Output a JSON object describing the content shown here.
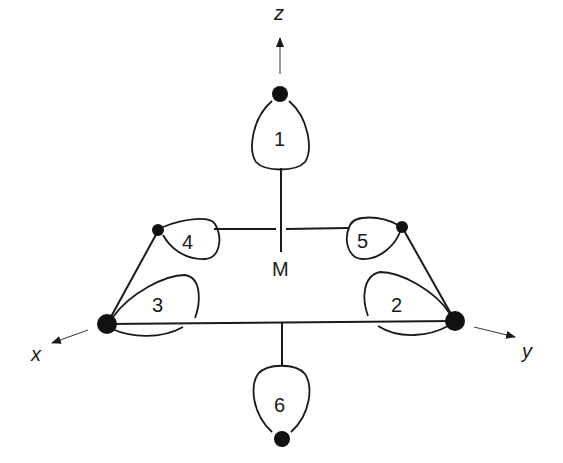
{
  "diagram": {
    "type": "octahedral d2sp3 / ligand orbital diagram",
    "center_label": "M",
    "axes": {
      "x": "x",
      "y": "y",
      "z": "z"
    },
    "lobes": [
      {
        "id": "1",
        "label": "1"
      },
      {
        "id": "2",
        "label": "2"
      },
      {
        "id": "3",
        "label": "3"
      },
      {
        "id": "4",
        "label": "4"
      },
      {
        "id": "5",
        "label": "5"
      },
      {
        "id": "6",
        "label": "6"
      }
    ],
    "colors": {
      "ink": "#1a1a1a",
      "background": "#ffffff"
    }
  }
}
